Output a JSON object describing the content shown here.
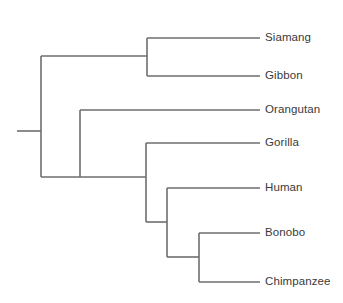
{
  "figure": {
    "kind": "phylogenetic-tree",
    "title": "",
    "orientation": "left-to-right rectangular cladogram",
    "background_color": "#ffffff",
    "line_color": "#6e6e6e",
    "line_width": 1.6,
    "text_color": "#3a3a3a"
  },
  "chart_data": {
    "type": "tree",
    "title": "",
    "xlabel": "",
    "ylabel": "",
    "leaf_count": 7,
    "leaves": [
      {
        "name": "Siamang",
        "x": 260,
        "y": 38
      },
      {
        "name": "Gibbon",
        "x": 260,
        "y": 76
      },
      {
        "name": "Orangutan",
        "x": 260,
        "y": 110
      },
      {
        "name": "Gorilla",
        "x": 260,
        "y": 143
      },
      {
        "name": "Human",
        "x": 260,
        "y": 188
      },
      {
        "name": "Bonobo",
        "x": 260,
        "y": 233
      },
      {
        "name": "Chimpanzee",
        "x": 260,
        "y": 282
      }
    ],
    "internal_nodes": [
      {
        "id": "root",
        "x": 41,
        "y_top": 56,
        "y_bottom": 177,
        "label": ""
      },
      {
        "id": "hylobates",
        "x": 147,
        "y_top": 38,
        "y_bottom": 76,
        "label": ""
      },
      {
        "id": "hominidae",
        "x": 80,
        "y_top": 110,
        "y_bottom": 177,
        "label": ""
      },
      {
        "id": "homininae",
        "x": 146,
        "y_top": 143,
        "y_bottom": 222,
        "label": ""
      },
      {
        "id": "hominini",
        "x": 167,
        "y_top": 188,
        "y_bottom": 257,
        "label": ""
      },
      {
        "id": "pan",
        "x": 199,
        "y_top": 233,
        "y_bottom": 282,
        "label": ""
      }
    ],
    "root_stub": {
      "x_start": 17,
      "x_end": 41,
      "y": 131
    },
    "edges": [
      {
        "from": "root",
        "to": "hylobates",
        "y": 56,
        "x_start": 41,
        "x_end": 147
      },
      {
        "from": "hylobates",
        "to": "Siamang",
        "y": 38,
        "x_start": 147,
        "x_end": 260
      },
      {
        "from": "hylobates",
        "to": "Gibbon",
        "y": 76,
        "x_start": 147,
        "x_end": 260
      },
      {
        "from": "root",
        "to": "hominidae",
        "y": 177,
        "x_start": 41,
        "x_end": 80
      },
      {
        "from": "hominidae",
        "to": "Orangutan",
        "y": 110,
        "x_start": 80,
        "x_end": 260
      },
      {
        "from": "hominidae",
        "to": "homininae",
        "y": 177,
        "x_start": 80,
        "x_end": 146
      },
      {
        "from": "homininae",
        "to": "Gorilla",
        "y": 143,
        "x_start": 146,
        "x_end": 260
      },
      {
        "from": "homininae",
        "to": "hominini",
        "y": 222,
        "x_start": 146,
        "x_end": 167
      },
      {
        "from": "hominini",
        "to": "Human",
        "y": 188,
        "x_start": 167,
        "x_end": 260
      },
      {
        "from": "hominini",
        "to": "pan",
        "y": 257,
        "x_start": 167,
        "x_end": 199
      },
      {
        "from": "pan",
        "to": "Bonobo",
        "y": 233,
        "x_start": 199,
        "x_end": 260
      },
      {
        "from": "pan",
        "to": "Chimpanzee",
        "y": 282,
        "x_start": 199,
        "x_end": 260
      }
    ]
  },
  "labels": {
    "siamang": "Siamang",
    "gibbon": "Gibbon",
    "orangutan": "Orangutan",
    "gorilla": "Gorilla",
    "human": "Human",
    "bonobo": "Bonobo",
    "chimpanzee": "Chimpanzee"
  }
}
